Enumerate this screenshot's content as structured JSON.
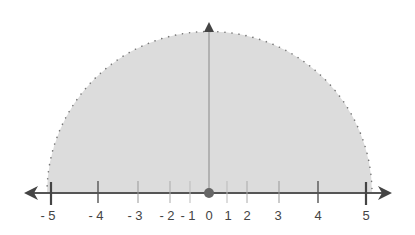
{
  "diagram": {
    "type": "semicircle-number-line",
    "fill_color": "#dcdcdc",
    "axis_color": "#555555",
    "dot_color": "#666666",
    "origin_label": "0",
    "ticks": [
      {
        "value": "- 5",
        "x": 51,
        "major": true
      },
      {
        "value": "- 4",
        "x": 98,
        "major": false
      },
      {
        "value": "- 3",
        "x": 138,
        "major": false
      },
      {
        "value": "- 2",
        "x": 170,
        "major": false
      },
      {
        "value": "- 1",
        "x": 190,
        "major": false
      },
      {
        "value": "0",
        "x": 209,
        "major": false
      },
      {
        "value": "1",
        "x": 227,
        "major": false
      },
      {
        "value": "2",
        "x": 247,
        "major": false
      },
      {
        "value": "3",
        "x": 279,
        "major": false
      },
      {
        "value": "4",
        "x": 318,
        "major": false
      },
      {
        "value": "5",
        "x": 366,
        "major": true
      }
    ]
  },
  "labels": {
    "t0": "- 5",
    "t1": "- 4",
    "t2": "- 3",
    "t3": "- 2",
    "t4": "- 1",
    "t5": "0",
    "t6": "1",
    "t7": "2",
    "t8": "3",
    "t9": "4",
    "t10": "5"
  }
}
